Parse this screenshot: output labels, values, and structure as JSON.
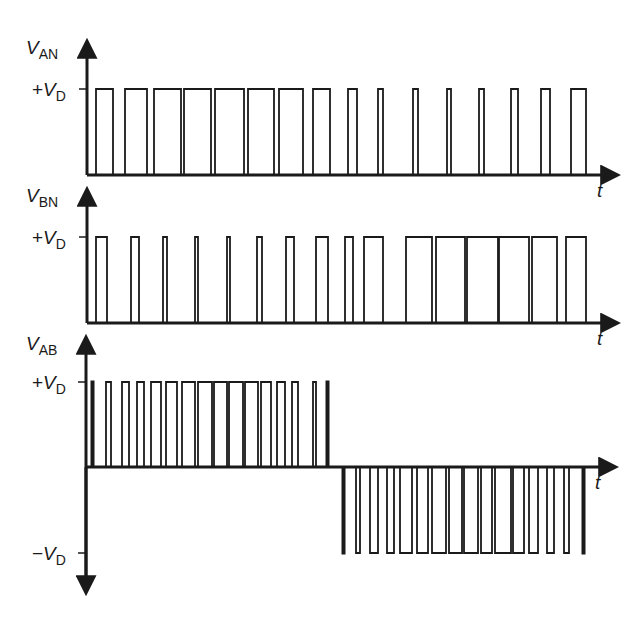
{
  "diagram": {
    "title": "",
    "stroke_color": "#1a1a1a",
    "background": "#ffffff",
    "axis_time_label": "t",
    "panels": [
      {
        "id": "van",
        "y_label_main": "V",
        "y_label_sub": "AN",
        "level_label_sign": "+",
        "level_label_main": "V",
        "level_label_sub": "D",
        "axis_x": 87,
        "zero_y": 175,
        "level_y": 89,
        "top_y": 42,
        "end_x": 617,
        "pulses": [
          [
            96,
            113
          ],
          [
            125,
            147
          ],
          [
            154,
            181
          ],
          [
            184,
            211
          ],
          [
            215,
            244
          ],
          [
            248,
            274
          ],
          [
            279,
            303
          ],
          [
            313,
            330
          ],
          [
            348,
            357
          ],
          [
            378,
            383
          ],
          [
            413,
            418
          ],
          [
            447,
            451
          ],
          [
            479,
            484
          ],
          [
            511,
            518
          ],
          [
            541,
            550
          ],
          [
            571,
            586
          ]
        ]
      },
      {
        "id": "vbn",
        "y_label_main": "V",
        "y_label_sub": "BN",
        "level_label_sign": "+",
        "level_label_main": "V",
        "level_label_sub": "D",
        "axis_x": 87,
        "zero_y": 323,
        "level_y": 237,
        "top_y": 190,
        "end_x": 617,
        "pulses": [
          [
            96,
            107
          ],
          [
            131,
            139
          ],
          [
            163,
            167
          ],
          [
            195,
            198
          ],
          [
            227,
            230
          ],
          [
            257,
            262
          ],
          [
            286,
            294
          ],
          [
            316,
            328
          ],
          [
            345,
            353
          ],
          [
            364,
            383
          ],
          [
            406,
            432
          ],
          [
            436,
            465
          ],
          [
            467,
            498
          ],
          [
            499,
            529
          ],
          [
            532,
            557
          ],
          [
            566,
            586
          ]
        ]
      },
      {
        "id": "vab",
        "y_label_main": "V",
        "y_label_sub": "AB",
        "level_label_sign": "+",
        "level_label_main": "V",
        "level_label_sub": "D",
        "neg_label_sign": "−",
        "neg_label_main": "V",
        "neg_label_sub": "D",
        "axis_x": 86,
        "zero_y": 467,
        "level_y": 382,
        "neg_y": 553,
        "top_y": 338,
        "bottom_y": 592,
        "end_x": 615,
        "pos_pulses": [
          [
            92,
            93
          ],
          [
            106,
            111
          ],
          [
            122,
            129
          ],
          [
            137,
            144
          ],
          [
            151,
            161
          ],
          [
            166,
            177
          ],
          [
            182,
            195
          ],
          [
            198,
            212
          ],
          [
            214,
            227
          ],
          [
            229,
            243
          ],
          [
            245,
            258
          ],
          [
            261,
            271
          ],
          [
            277,
            285
          ],
          [
            292,
            298
          ],
          [
            313,
            316
          ],
          [
            327,
            328
          ]
        ],
        "neg_pulses": [
          [
            343,
            344
          ],
          [
            356,
            360
          ],
          [
            370,
            378
          ],
          [
            387,
            394
          ],
          [
            400,
            412
          ],
          [
            417,
            428
          ],
          [
            432,
            446
          ],
          [
            449,
            462
          ],
          [
            464,
            478
          ],
          [
            481,
            492
          ],
          [
            495,
            511
          ],
          [
            513,
            524
          ],
          [
            529,
            538
          ],
          [
            547,
            554
          ],
          [
            564,
            569
          ],
          [
            583,
            584
          ]
        ]
      }
    ]
  }
}
